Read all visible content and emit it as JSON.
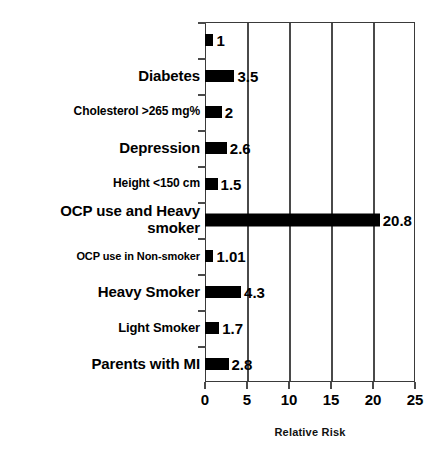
{
  "chart_data": {
    "type": "bar",
    "orientation": "horizontal",
    "title": "",
    "xlabel": "Relative Risk",
    "ylabel": "",
    "xlim": [
      0,
      25
    ],
    "xticks": [
      0,
      5,
      10,
      15,
      20,
      25
    ],
    "xtick_labels": [
      "0",
      "5",
      "10",
      "15",
      "20",
      "25"
    ],
    "grid": "vertical",
    "legend": "none",
    "bar_color": "#000000",
    "categories": [
      "",
      "Diabetes",
      "Cholesterol >265 mg%",
      "Depression",
      "Height <150 cm",
      "OCP use and Heavy\nsmoker",
      "OCP use in Non-smoker",
      "Heavy Smoker",
      "Light Smoker",
      "Parents with MI"
    ],
    "values": [
      1,
      3.5,
      2,
      2.6,
      1.5,
      20.8,
      1.01,
      4.3,
      1.7,
      2.8
    ],
    "value_labels": [
      "1",
      "3.5",
      "2",
      "2.6",
      "1.5",
      "20.8",
      "1.01",
      "4.3",
      "1.7",
      "2.8"
    ],
    "label_font_sizes": [
      14,
      15,
      12,
      15,
      12,
      15,
      11,
      15,
      13,
      15
    ]
  },
  "axis": {
    "x_title": "Relative Risk"
  }
}
